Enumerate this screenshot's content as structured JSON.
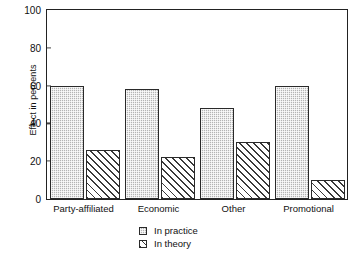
{
  "chart_data": {
    "type": "bar",
    "title": "",
    "xlabel": "",
    "ylabel": "Effect in percents",
    "ylim": [
      0,
      100
    ],
    "yticks": [
      0,
      20,
      40,
      60,
      80,
      100
    ],
    "grid": false,
    "legend_position": "bottom-center",
    "categories": [
      "Party-affiliated",
      "Economic",
      "Other",
      "Promotional"
    ],
    "series": [
      {
        "name": "In practice",
        "values": [
          60,
          58,
          48,
          60
        ],
        "pattern": "dotted-gray"
      },
      {
        "name": "In theory",
        "values": [
          26,
          22,
          30,
          10
        ],
        "pattern": "diagonal-hatch"
      }
    ]
  },
  "axis": {
    "y_tick_labels": [
      "0",
      "20",
      "40",
      "60",
      "80",
      "100"
    ],
    "y_title": "Effect in percents"
  },
  "legend": {
    "items": [
      {
        "label": "In practice"
      },
      {
        "label": "In theory"
      }
    ]
  },
  "colors": {
    "practice_fill": "#b4b4b4",
    "theory_fill": "#ffffff",
    "bar_outline": "#2a2a2a",
    "axis": "#222222",
    "text": "#111111",
    "background": "#ffffff"
  }
}
